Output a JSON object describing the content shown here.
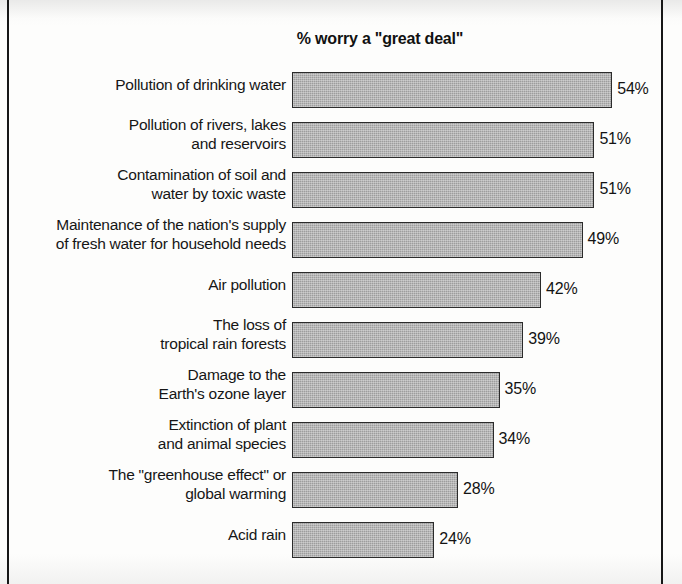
{
  "chart_data": {
    "type": "bar",
    "orientation": "horizontal",
    "title": "% worry a \"great deal\"",
    "xlabel": "",
    "ylabel": "",
    "xlim": [
      0,
      54
    ],
    "grid": false,
    "legend": null,
    "value_label_suffix": "%",
    "categories": [
      "Pollution of drinking water",
      "Pollution of rivers, lakes\nand reservoirs",
      "Contamination of soil and\nwater by toxic waste",
      "Maintenance of the nation's supply\nof fresh water for household needs",
      "Air pollution",
      "The loss of\ntropical rain forests",
      "Damage to the\nEarth's ozone layer",
      "Extinction of plant\nand animal species",
      "The \"greenhouse effect\" or\nglobal warming",
      "Acid rain"
    ],
    "values": [
      54,
      51,
      51,
      49,
      42,
      39,
      35,
      34,
      28,
      24
    ],
    "value_labels": [
      "54%",
      "51%",
      "51%",
      "49%",
      "42%",
      "39%",
      "35%",
      "34%",
      "28%",
      "24%"
    ],
    "bar_fill_color": "#9d9d9d",
    "bar_border_color": "#2b2b2b",
    "text_color": "#161616",
    "background_color": "#ffffff"
  }
}
